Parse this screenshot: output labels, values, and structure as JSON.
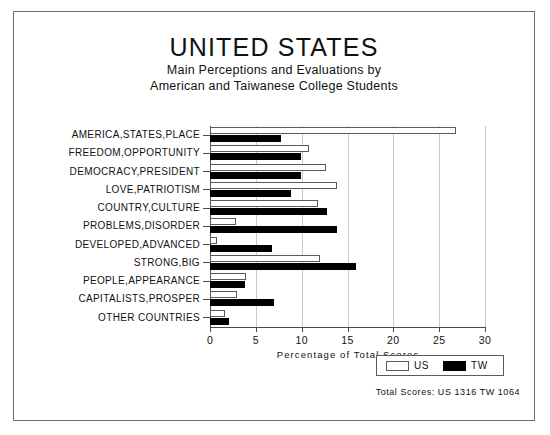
{
  "figure": {
    "title": "UNITED STATES",
    "subtitle_line1": "Main Perceptions and Evaluations by",
    "subtitle_line2": "American and Taiwanese College Students",
    "footnote": "Total Scores:  US 1316   TW 1064",
    "border_color": "#6e6e6e"
  },
  "legend": {
    "items": [
      {
        "label": "US",
        "color": "#ffffff",
        "swatch": "open-square-swatch"
      },
      {
        "label": "TW",
        "color": "#000000",
        "swatch": "filled-square-swatch"
      }
    ]
  },
  "chart_data": {
    "type": "bar",
    "orientation": "horizontal",
    "title": "UNITED STATES",
    "subtitle": "Main Perceptions and Evaluations by American and Taiwanese College Students",
    "xlabel": "Percentage of Total Scores",
    "ylabel": "",
    "xlim": [
      0,
      30
    ],
    "xticks": [
      0,
      5,
      10,
      15,
      20,
      25,
      30
    ],
    "xtick_labels": [
      "0",
      "5",
      "10",
      "15",
      "20",
      "25",
      "30"
    ],
    "grid": true,
    "legend_position": "bottom-right",
    "categories": [
      "AMERICA,STATES,PLACE",
      "FREEDOM,OPPORTUNITY",
      "DEMOCRACY,PRESIDENT",
      "LOVE,PATRIOTISM",
      "COUNTRY,CULTURE",
      "PROBLEMS,DISORDER",
      "DEVELOPED,ADVANCED",
      "STRONG,BIG",
      "PEOPLE,APPEARANCE",
      "CAPITALISTS,PROSPER",
      "OTHER COUNTRIES"
    ],
    "series": [
      {
        "name": "US",
        "color": "#ffffff",
        "values": [
          26.8,
          10.8,
          12.7,
          13.9,
          11.8,
          2.8,
          0.8,
          12.0,
          3.9,
          2.9,
          1.6
        ]
      },
      {
        "name": "TW",
        "color": "#000000",
        "values": [
          7.7,
          9.9,
          9.9,
          8.8,
          12.8,
          13.9,
          6.8,
          15.9,
          3.8,
          7.0,
          2.1
        ]
      }
    ],
    "annotations": [
      "Total Scores:  US 1316   TW 1064"
    ]
  }
}
